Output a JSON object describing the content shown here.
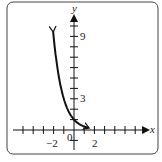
{
  "chart_data": {
    "type": "line",
    "title": "",
    "xlabel": "x",
    "ylabel": "y",
    "xlim": [
      -6,
      7
    ],
    "ylim": [
      -1.5,
      12
    ],
    "x_ticks_labeled": [
      "-2",
      "2"
    ],
    "y_ticks_labeled": [
      "3",
      "9"
    ],
    "origin_label": "0",
    "x_tick_step": 1,
    "y_tick_step": 1,
    "grid": false,
    "legend": null,
    "series": [
      {
        "name": "y = (1/3)^x",
        "x": [
          -2.1,
          -2,
          -1.5,
          -1,
          -0.5,
          0,
          0.5,
          1,
          1.5
        ],
        "y": [
          10.05,
          9,
          5.2,
          3,
          1.73,
          1,
          0.58,
          0.33,
          0.19
        ],
        "arrows": "both"
      }
    ]
  },
  "labels": {
    "x_axis": "x",
    "y_axis": "y",
    "neg2": "−2",
    "pos2": "2",
    "origin": "0",
    "y3": "3",
    "y9": "9"
  }
}
